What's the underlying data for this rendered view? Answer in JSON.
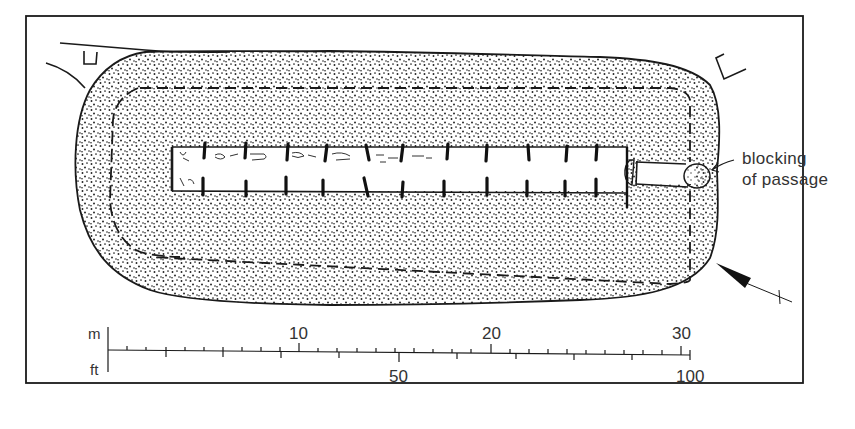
{
  "figure": {
    "type": "archaeological-site-plan",
    "colors": {
      "ink": "#1a1a1a",
      "stipple": "#222222",
      "background": "#ffffff",
      "label": "#333333"
    }
  },
  "annotations": {
    "blocking_line1": "blocking",
    "blocking_line2": "of passage"
  },
  "scale_bar": {
    "metric_unit": "m",
    "imperial_unit": "ft",
    "metric_ticks": [
      "10",
      "20",
      "30"
    ],
    "imperial_ticks": [
      "50",
      "100"
    ],
    "metric_range": [
      0,
      30
    ],
    "imperial_range": [
      0,
      100
    ]
  },
  "north_arrow": {
    "icon": "north-arrow-icon",
    "direction": "points up-left (north-west)"
  },
  "features": [
    {
      "name": "mound",
      "fill": "stippled"
    },
    {
      "name": "kerb",
      "style": "dashed inner outline"
    },
    {
      "name": "chamber",
      "style": "long gallery with paired orthostats"
    },
    {
      "name": "passage",
      "style": "entrance passage at east end"
    },
    {
      "name": "blocking",
      "style": "stippled ellipse at passage mouth"
    },
    {
      "name": "ditch-feature-nw",
      "style": "small rectangular marker"
    },
    {
      "name": "ditch-feature-ne",
      "style": "small bracket marker"
    }
  ]
}
